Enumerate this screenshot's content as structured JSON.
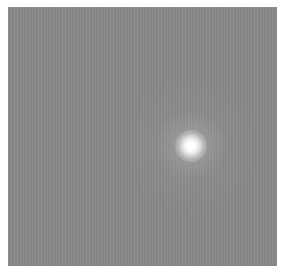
{
  "image": {
    "description": "Grayscale noisy background with a single bright glowing point source",
    "colors": {
      "background": "#8a8a8a",
      "border": "#ffffff",
      "spot": "#ffffff"
    },
    "spot": {
      "center_x": 191,
      "center_y": 146
    }
  }
}
